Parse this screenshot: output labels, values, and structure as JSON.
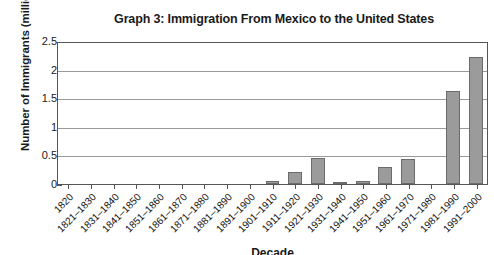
{
  "chart_data": {
    "type": "bar",
    "title": "Graph 3: Immigration From Mexico to the United States",
    "xlabel": "Decade",
    "ylabel": "Number of Immigrants (millions)",
    "ylim": [
      0,
      2.5
    ],
    "yticks": [
      0,
      0.5,
      1,
      1.5,
      2,
      2.5
    ],
    "ytick_labels": [
      "0",
      "0.5",
      "1",
      "1.5",
      "2",
      "2.5"
    ],
    "grid": true,
    "legend": "none",
    "bar_color": "#9b9b9b",
    "bar_edge_color": "#6b6b6b",
    "categories": [
      "1820",
      "1821–1830",
      "1831–1840",
      "1841–1850",
      "1851–1860",
      "1861–1870",
      "1871–1880",
      "1881–1890",
      "1891–1900",
      "1901–1910",
      "1911–1920",
      "1921–1930",
      "1931–1940",
      "1941–1950",
      "1951–1960",
      "1961–1970",
      "1971–1980",
      "1981–1990",
      "1991–2000"
    ],
    "values": [
      0,
      0,
      0,
      0,
      0,
      0,
      0,
      0,
      0,
      0.05,
      0.22,
      0.46,
      0.02,
      0.06,
      0.3,
      0.45,
      0,
      1.65,
      2.25
    ]
  }
}
